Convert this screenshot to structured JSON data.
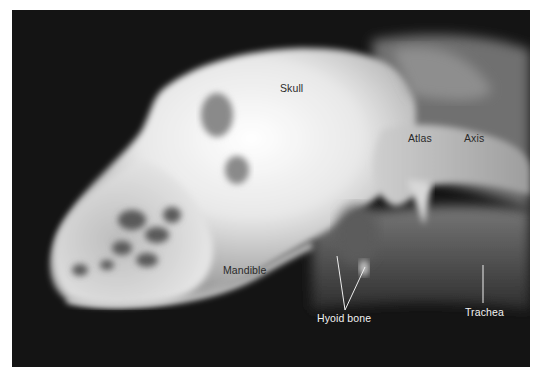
{
  "figure": {
    "labels": {
      "skull": "Skull",
      "atlas": "Atlas",
      "axis": "Axis",
      "mandible": "Mandible",
      "hyoid_bone": "Hyoid bone",
      "trachea": "Trachea"
    },
    "colors": {
      "background": "#141414",
      "bone": "#f4f4f4",
      "soft_tissue": "#6a6a6a",
      "dark_label": "#2a2a2a",
      "light_label": "#f2f2f2"
    }
  }
}
